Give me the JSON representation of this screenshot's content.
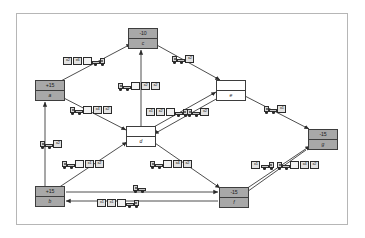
{
  "diagram": {
    "background_color": "#ffffff",
    "frame_color": "#b6b6b6",
    "supply_node_color": "#a8a8a8",
    "transshipment_node_color": "#ffffff",
    "edge_color": "#333333"
  },
  "nodes": [
    {
      "id": "c",
      "name": "c",
      "value": "-10",
      "type": "demand",
      "x": 128,
      "y": 28
    },
    {
      "id": "a",
      "name": "a",
      "value": "+15",
      "type": "supply",
      "x": 35,
      "y": 80
    },
    {
      "id": "e",
      "name": "e",
      "value": "",
      "type": "transshipment",
      "x": 216,
      "y": 80
    },
    {
      "id": "d",
      "name": "d",
      "value": "",
      "type": "transshipment",
      "x": 126,
      "y": 126
    },
    {
      "id": "g",
      "name": "g",
      "value": "-15",
      "type": "demand",
      "x": 308,
      "y": 129
    },
    {
      "id": "b",
      "name": "b",
      "value": "+15",
      "type": "supply",
      "x": 35,
      "y": 186
    },
    {
      "id": "f",
      "name": "f",
      "value": "-15",
      "type": "demand",
      "x": 219,
      "y": 187
    }
  ],
  "edges": [
    {
      "from": "a",
      "to": "c",
      "label": "x6 x2",
      "direction": "to-c"
    },
    {
      "from": "c",
      "to": "e",
      "label": "x2",
      "direction": "to-e"
    },
    {
      "from": "d",
      "to": "c",
      "label": "x2 x2",
      "direction": "bidirectional"
    },
    {
      "from": "a",
      "to": "d",
      "label": "x4 x2",
      "direction": "to-d"
    },
    {
      "from": "a",
      "to": "b",
      "label": "x2",
      "direction": "to-a"
    },
    {
      "from": "d",
      "to": "e",
      "label": "x2 x1 x2",
      "direction": "bidirectional"
    },
    {
      "from": "e",
      "to": "g",
      "label": "x1",
      "direction": "to-g"
    },
    {
      "from": "b",
      "to": "d",
      "label": "x1 x2",
      "direction": "to-d"
    },
    {
      "from": "d",
      "to": "f",
      "label": "x4 x2",
      "direction": "to-f"
    },
    {
      "from": "f",
      "to": "g",
      "label": "x1 x4 x2",
      "direction": "bidirectional"
    },
    {
      "from": "b",
      "to": "f",
      "label": "x1",
      "direction": "to-f"
    },
    {
      "from": "f",
      "to": "b",
      "label": "x1 x1",
      "direction": "to-b"
    }
  ],
  "edge_labels": [
    {
      "id": "l-ac",
      "x": 63,
      "y": 54,
      "rtl": true,
      "boxes": [
        "x6",
        "x2"
      ]
    },
    {
      "id": "l-ce",
      "x": 172,
      "y": 52,
      "rtl": false,
      "boxes": [
        "x2"
      ]
    },
    {
      "id": "l-dc",
      "x": 118,
      "y": 79,
      "rtl": false,
      "boxes": [
        "x2",
        "x2"
      ]
    },
    {
      "id": "l-ad",
      "x": 70,
      "y": 103,
      "rtl": false,
      "boxes": [
        "x4",
        "x2"
      ]
    },
    {
      "id": "l-de1",
      "x": 146,
      "y": 105,
      "rtl": true,
      "boxes": [
        "x2",
        "x1"
      ]
    },
    {
      "id": "l-de2",
      "x": 187,
      "y": 105,
      "rtl": false,
      "boxes": [
        "x2"
      ]
    },
    {
      "id": "l-eg",
      "x": 264,
      "y": 102,
      "rtl": false,
      "boxes": [
        "x1"
      ]
    },
    {
      "id": "l-ab",
      "x": 40,
      "y": 137,
      "rtl": false,
      "boxes": [
        "x2"
      ]
    },
    {
      "id": "l-bd",
      "x": 62,
      "y": 157,
      "rtl": false,
      "boxes": [
        "x1",
        "x2"
      ]
    },
    {
      "id": "l-df",
      "x": 150,
      "y": 157,
      "rtl": false,
      "boxes": [
        "x4",
        "x2"
      ]
    },
    {
      "id": "l-fg1",
      "x": 251,
      "y": 158,
      "rtl": true,
      "boxes": [
        "x1"
      ]
    },
    {
      "id": "l-fg2",
      "x": 277,
      "y": 158,
      "rtl": false,
      "boxes": [
        "x4",
        "x2"
      ]
    },
    {
      "id": "l-bf",
      "x": 133,
      "y": 181,
      "rtl": false,
      "boxes": []
    },
    {
      "id": "l-fb",
      "x": 97,
      "y": 196,
      "rtl": true,
      "boxes": [
        "x1",
        "x1"
      ]
    }
  ]
}
